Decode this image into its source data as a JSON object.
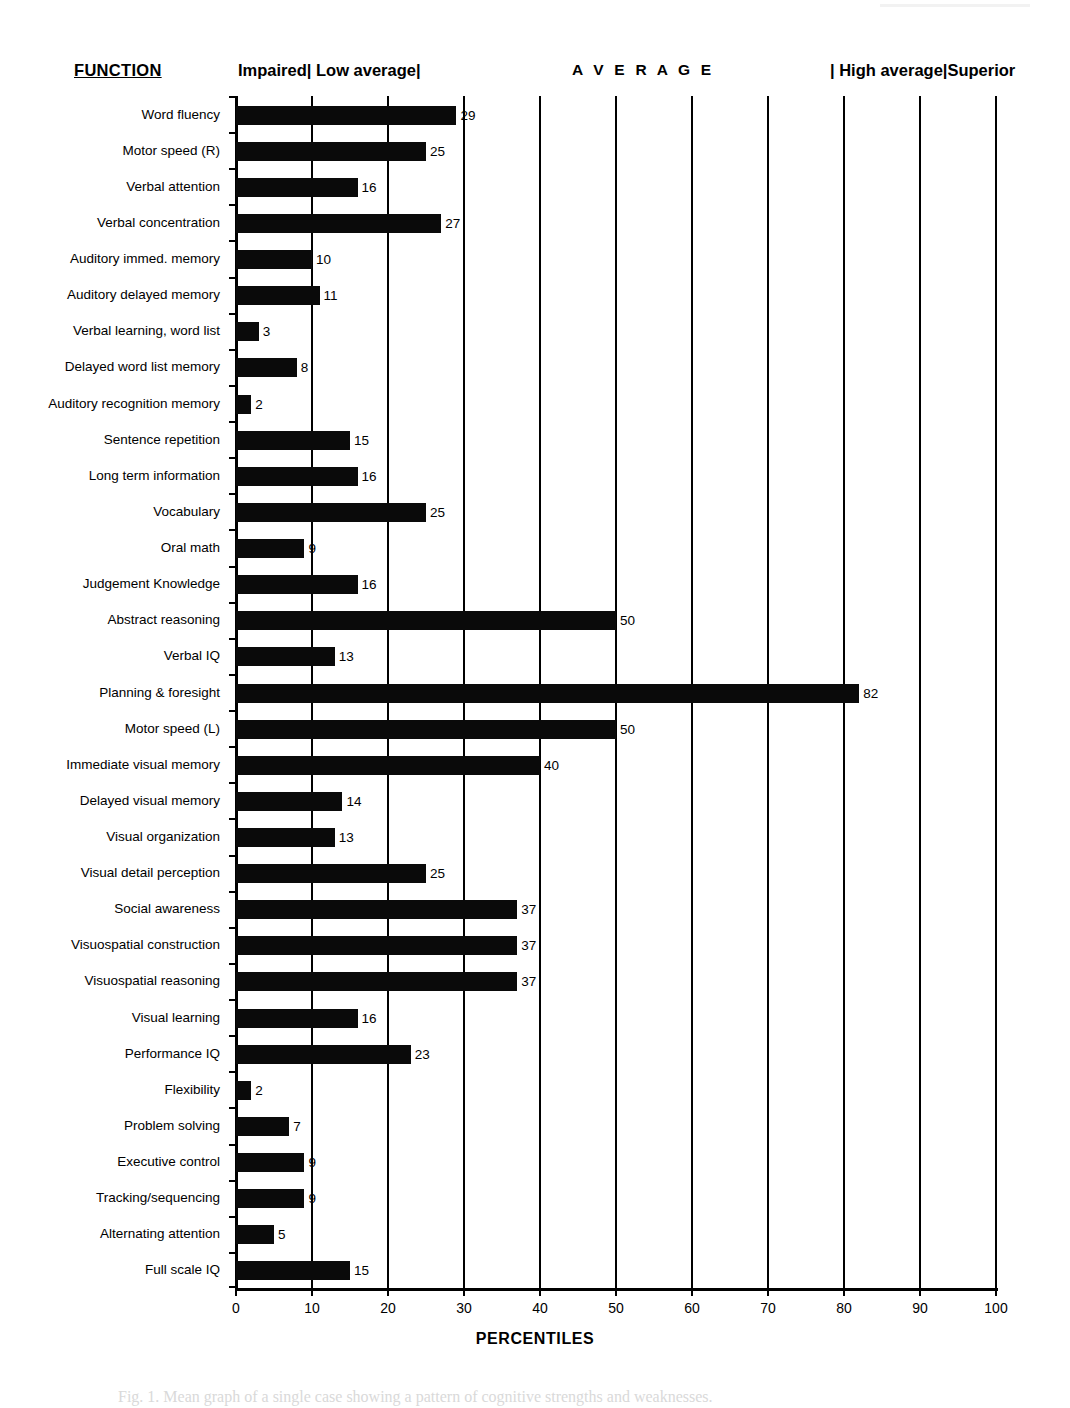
{
  "header": {
    "function_heading": "FUNCTION",
    "band_impaired_low": "Impaired| Low average|",
    "band_average": "A V E R A G E",
    "band_high_superior": "| High average|Superior"
  },
  "axis": {
    "title": "PERCENTILES",
    "ticks": [
      "0",
      "10",
      "20",
      "30",
      "40",
      "50",
      "60",
      "70",
      "80",
      "90",
      "100"
    ]
  },
  "caption": "Fig. 1.  Mean graph of a single case showing a pattern of cognitive strengths and weaknesses.",
  "chart_data": {
    "type": "bar",
    "orientation": "horizontal",
    "title": "",
    "xlabel": "PERCENTILES",
    "ylabel": "FUNCTION",
    "xlim": [
      0,
      100
    ],
    "xticks": [
      0,
      10,
      20,
      30,
      40,
      50,
      60,
      70,
      80,
      90,
      100
    ],
    "grid": true,
    "grid_axis": "x",
    "legend": "none",
    "bar_color": "#000000",
    "band_labels": [
      "Impaired| Low average|",
      "A V E R A G E",
      "| High average|Superior"
    ],
    "categories": [
      "Word fluency",
      "Motor speed (R)",
      "Verbal attention",
      "Verbal concentration",
      "Auditory immed. memory",
      "Auditory delayed memory",
      "Verbal learning, word list",
      "Delayed word list memory",
      "Auditory recognition memory",
      "Sentence repetition",
      "Long term information",
      "Vocabulary",
      "Oral math",
      "Judgement Knowledge",
      "Abstract reasoning",
      "Verbal IQ",
      "Planning & foresight",
      "Motor speed (L)",
      "Immediate visual memory",
      "Delayed visual memory",
      "Visual organization",
      "Visual detail perception",
      "Social awareness",
      "Visuospatial construction",
      "Visuospatial reasoning",
      "Visual learning",
      "Performance IQ",
      "Flexibility",
      "Problem solving",
      "Executive control",
      "Tracking/sequencing",
      "Alternating attention",
      "Full scale IQ"
    ],
    "values": [
      29,
      25,
      16,
      27,
      10,
      11,
      3,
      8,
      2,
      15,
      16,
      25,
      9,
      16,
      50,
      13,
      82,
      50,
      40,
      14,
      13,
      25,
      37,
      37,
      37,
      16,
      23,
      2,
      7,
      9,
      9,
      5,
      15
    ]
  }
}
